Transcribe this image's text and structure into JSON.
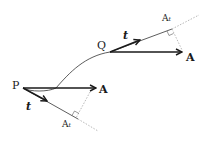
{
  "diagram": {
    "points": {
      "P": {
        "label": "P",
        "x": 23,
        "y": 88
      },
      "Q": {
        "label": "Q",
        "x": 110,
        "y": 52
      }
    },
    "vectors": {
      "A_at_P": {
        "label": "A"
      },
      "t_at_P": {
        "label": "t"
      },
      "At_at_P": {
        "label": "A",
        "subscript": "t"
      },
      "A_at_Q": {
        "label": "A"
      },
      "t_at_Q": {
        "label": "t"
      },
      "At_at_Q": {
        "label": "A",
        "subscript": "t"
      }
    },
    "colors": {
      "stroke": "#1a1a1a",
      "dotted": "#9a9a9a",
      "background": "#ffffff"
    }
  }
}
